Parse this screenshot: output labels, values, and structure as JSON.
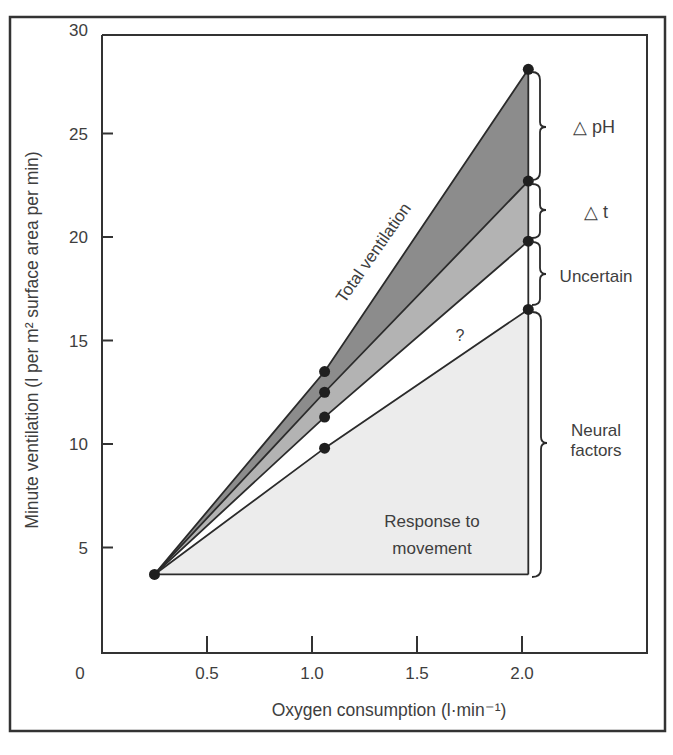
{
  "chart_data": {
    "type": "area",
    "title": "",
    "xlabel": "Oxygen consumption (l·min⁻¹)",
    "ylabel": "Minute ventilation (l per m² surface area per min)",
    "xlim": [
      0,
      2.5
    ],
    "ylim": [
      0,
      30
    ],
    "x_ticks": [
      "0.5",
      "1.0",
      "1.5",
      "2.0"
    ],
    "y_ticks": [
      "5",
      "10",
      "15",
      "20",
      "25",
      "30"
    ],
    "origin_label": "0",
    "grid": false,
    "x": [
      0.25,
      1.06,
      2.03
    ],
    "series": [
      {
        "name": "Total ventilation",
        "values": [
          3.7,
          13.5,
          28.1
        ],
        "fill": "#8c8c8c"
      },
      {
        "name": "Without ΔpH",
        "values": [
          3.7,
          12.5,
          22.7
        ],
        "fill": "#b3b3b3"
      },
      {
        "name": "Without Δt",
        "values": [
          3.7,
          11.3,
          19.8
        ],
        "fill": "#ffffff"
      },
      {
        "name": "Response to movement",
        "values": [
          3.7,
          9.8,
          16.5
        ],
        "fill": "#ececec"
      }
    ],
    "baseline": 3.7,
    "annotations": {
      "total_ventilation": "Total ventilation",
      "question": "?",
      "response": [
        "Response to",
        "movement"
      ],
      "delta_ph": "△ pH",
      "delta_t": "△ t",
      "uncertain": "Uncertain",
      "neural": [
        "Neural",
        "factors"
      ]
    }
  },
  "colors": {
    "dark_band": "#8c8c8c",
    "mid_band": "#b3b3b3",
    "light_region": "#ececec",
    "line": "#2b2b2b"
  }
}
